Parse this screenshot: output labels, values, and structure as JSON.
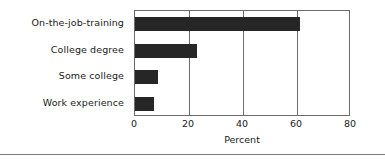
{
  "chart_data": {
    "type": "bar",
    "orientation": "horizontal",
    "title": "",
    "xlabel": "Percent",
    "ylabel": "",
    "categories": [
      "On-the-job-training",
      "College degree",
      "Some college",
      "Work experience"
    ],
    "values": [
      61,
      23,
      8.5,
      7
    ],
    "xlim": [
      0,
      80
    ],
    "xticks": [
      0,
      20,
      40,
      60,
      80
    ],
    "xtick_labels": [
      "0",
      "20",
      "40",
      "60",
      "80"
    ],
    "grid": true,
    "grid_axis": "x",
    "legend": false,
    "bar_color": "#262626",
    "axis_color": "#6b6b6b",
    "text_color": "#1a1a1a",
    "background_color": "#ffffff"
  }
}
